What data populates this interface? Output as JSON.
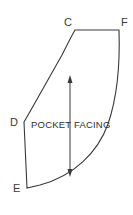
{
  "figure": {
    "name": "pocket-facing-pattern-piece",
    "background_color": "#ffffff",
    "line_color": "#3a3a3a",
    "width": 133,
    "height": 215
  },
  "piece": {
    "label": "POCKET FACING",
    "label_x": 31,
    "label_y": 128
  },
  "vertices": [
    {
      "id": "C",
      "label": "C",
      "x": 75,
      "y": 30,
      "label_x": 64,
      "label_y": 26
    },
    {
      "id": "F",
      "label": "F",
      "x": 119,
      "y": 30,
      "label_x": 121,
      "label_y": 26
    },
    {
      "id": "D",
      "label": "D",
      "x": 24,
      "y": 122,
      "label_x": 10,
      "label_y": 126
    },
    {
      "id": "E",
      "label": "E",
      "x": 27,
      "y": 188,
      "label_x": 13,
      "label_y": 192
    }
  ],
  "outline": {
    "description": "Closed pattern outline: straight top edge C to F, curved right edge F down to bottom-right, curved bottom edge back to E, straight left edge E up to D, curved inner edge D up to C.",
    "path": "M 75 30 L 119 30 C 120 60 118 95 108 124 C 98 152 74 176 40 185 L 27 188 L 24 122 C 34 105 50 76 62 55 C 67 45 71 37 75 30 Z"
  },
  "grainline": {
    "name": "grainline-arrow",
    "x": 70,
    "y_top": 75,
    "y_bottom": 177,
    "double_headed": true,
    "head_width": 5,
    "head_length": 8
  }
}
